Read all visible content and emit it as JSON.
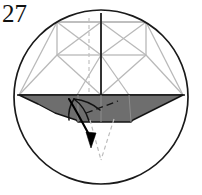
{
  "figure": {
    "kind": "origami-folding-diagram",
    "step_number": "27",
    "caption": "",
    "colors": {
      "background": "#ffffff",
      "outline_dark": "#1a1a1a",
      "crease_light": "#b8b8b8",
      "crease_dashed": "#c0c0c0",
      "shaded_fill": "#6e6e6e",
      "shaded_edge": "#111111",
      "arrow": "#000000",
      "text": "#111111"
    },
    "circle": {
      "label": "diagram-boundary-circle",
      "center_x": 101,
      "center_y": 97,
      "radius": 88,
      "stroke_width": 1.6
    },
    "elements": {
      "step_number_label": "27",
      "horizontal_fold_line_label": "horizontal-fold-line",
      "vertical_center_line_label": "vertical-center-line",
      "left_panel_label": "left-crease-panel",
      "right_panel_label": "right-crease-panel",
      "shaded_flap_label": "shaded-flap",
      "fold_arrow_label": "fold-direction-arrow",
      "guide_dashes_label": "guide-dashed-lines"
    }
  }
}
